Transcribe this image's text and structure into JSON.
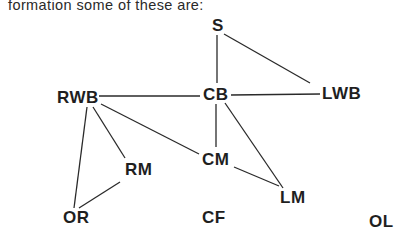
{
  "caption": "formation some of these are:",
  "nodes": {
    "S": {
      "label": "S",
      "x": 212,
      "y": 17
    },
    "CB": {
      "label": "CB",
      "x": 203,
      "y": 86
    },
    "RWB": {
      "label": "RWB",
      "x": 57,
      "y": 89
    },
    "LWB": {
      "label": "LWB",
      "x": 322,
      "y": 85
    },
    "CM": {
      "label": "CM",
      "x": 202,
      "y": 151
    },
    "RM": {
      "label": "RM",
      "x": 125,
      "y": 161
    },
    "LM": {
      "label": "LM",
      "x": 280,
      "y": 189
    },
    "OR": {
      "label": "OR",
      "x": 63,
      "y": 209
    },
    "CF": {
      "label": "CF",
      "x": 202,
      "y": 209
    },
    "OL": {
      "label": "OL",
      "x": 369,
      "y": 213
    }
  },
  "edges": [
    {
      "from": "S",
      "to": "CB"
    },
    {
      "from": "S",
      "to": "LWB"
    },
    {
      "from": "RWB",
      "to": "CB"
    },
    {
      "from": "CB",
      "to": "LWB"
    },
    {
      "from": "CB",
      "to": "CM"
    },
    {
      "from": "CB",
      "to": "LM"
    },
    {
      "from": "CM",
      "to": "LM"
    },
    {
      "from": "RWB",
      "to": "CM"
    },
    {
      "from": "RWB",
      "to": "RM"
    },
    {
      "from": "RWB",
      "to": "OR"
    },
    {
      "from": "RM",
      "to": "OR"
    }
  ],
  "colors": {
    "line": "#2a2a2a",
    "text": "#1f1f1f"
  }
}
